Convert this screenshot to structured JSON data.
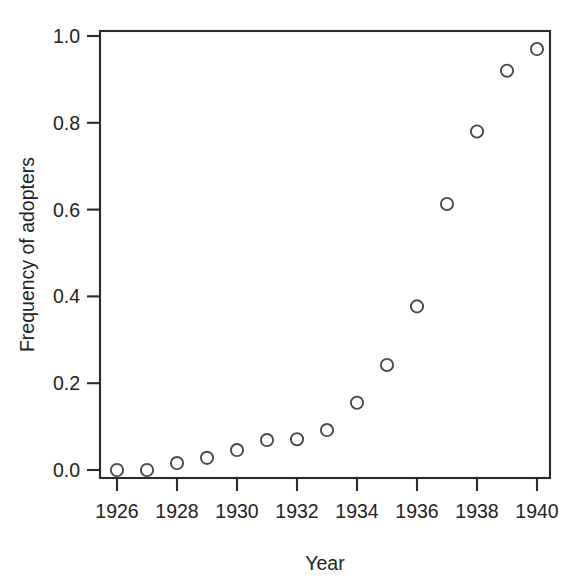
{
  "chart_data": {
    "type": "scatter",
    "title": "",
    "xlabel": "Year",
    "ylabel": "Frequency of adopters",
    "x": [
      1926,
      1927,
      1928,
      1929,
      1930,
      1931,
      1932,
      1933,
      1934,
      1935,
      1936,
      1937,
      1938,
      1939,
      1940
    ],
    "values": [
      0.0,
      0.0,
      0.016,
      0.028,
      0.046,
      0.069,
      0.071,
      0.092,
      0.155,
      0.242,
      0.377,
      0.613,
      0.78,
      0.92,
      0.97
    ],
    "xlim": [
      1925.5,
      1940.5
    ],
    "ylim": [
      -0.02,
      1.02
    ],
    "xticks": [
      1926,
      1928,
      1930,
      1932,
      1934,
      1936,
      1938,
      1940
    ],
    "xtick_labels": [
      "1926",
      "1928",
      "1930",
      "1932",
      "1934",
      "1936",
      "1938",
      "1940"
    ],
    "yticks": [
      0.0,
      0.2,
      0.4,
      0.6,
      0.8,
      1.0
    ],
    "ytick_labels": [
      "0.0",
      "0.2",
      "0.4",
      "0.6",
      "0.8",
      "1.0"
    ],
    "grid": false,
    "legend": null,
    "marker": "open-circle",
    "marker_color": "#4a4a4a",
    "axis_color": "#2b2b2b",
    "background": "#ffffff"
  },
  "figure": {
    "xlabel": "Year",
    "ylabel": "Frequency of adopters"
  }
}
